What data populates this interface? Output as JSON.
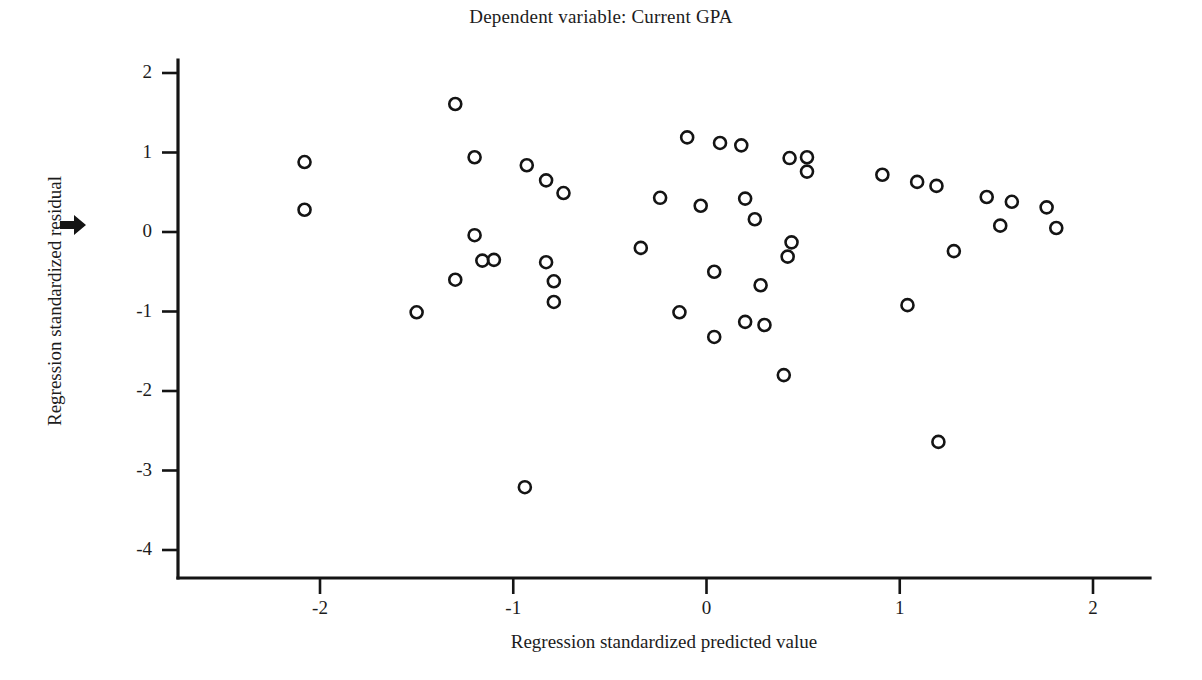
{
  "chart_data": {
    "type": "scatter",
    "title": "Dependent variable: Current GPA",
    "xlabel": "Regression standardized predicted value",
    "ylabel": "Regression standardized residual",
    "xlim": [
      -2.73,
      2.29
    ],
    "ylim": [
      -4.35,
      2.25
    ],
    "xticks": [
      -2,
      -1,
      0,
      1,
      2
    ],
    "xtick_labels": [
      "-2",
      "-1",
      "0",
      "1",
      "2"
    ],
    "yticks": [
      2,
      1,
      0,
      -1,
      -2,
      -3,
      -4
    ],
    "ytick_labels": [
      "2",
      "1",
      "0",
      "-1",
      "-2",
      "-3",
      "-4"
    ],
    "grid": false,
    "legend": false,
    "marker": "open-circle",
    "marker_color": "#141414",
    "points": [
      {
        "x": -2.08,
        "y": 0.88
      },
      {
        "x": -2.08,
        "y": 0.28
      },
      {
        "x": -1.3,
        "y": 1.61
      },
      {
        "x": -1.2,
        "y": 0.94
      },
      {
        "x": -1.2,
        "y": -0.04
      },
      {
        "x": -1.16,
        "y": -0.36
      },
      {
        "x": -1.1,
        "y": -0.35
      },
      {
        "x": -1.3,
        "y": -0.6
      },
      {
        "x": -1.5,
        "y": -1.01
      },
      {
        "x": -0.93,
        "y": 0.84
      },
      {
        "x": -0.83,
        "y": 0.65
      },
      {
        "x": -0.74,
        "y": 0.49
      },
      {
        "x": -0.83,
        "y": -0.38
      },
      {
        "x": -0.79,
        "y": -0.62
      },
      {
        "x": -0.79,
        "y": -0.88
      },
      {
        "x": -0.94,
        "y": -3.21
      },
      {
        "x": -0.34,
        "y": -0.2
      },
      {
        "x": -0.1,
        "y": 1.19
      },
      {
        "x": 0.07,
        "y": 1.12
      },
      {
        "x": 0.18,
        "y": 1.09
      },
      {
        "x": 0.43,
        "y": 0.93
      },
      {
        "x": 0.52,
        "y": 0.94
      },
      {
        "x": 0.52,
        "y": 0.76
      },
      {
        "x": -0.24,
        "y": 0.43
      },
      {
        "x": -0.03,
        "y": 0.33
      },
      {
        "x": 0.2,
        "y": 0.42
      },
      {
        "x": 0.25,
        "y": 0.16
      },
      {
        "x": 0.44,
        "y": -0.13
      },
      {
        "x": 0.42,
        "y": -0.31
      },
      {
        "x": 0.04,
        "y": -0.5
      },
      {
        "x": 0.28,
        "y": -0.67
      },
      {
        "x": -0.14,
        "y": -1.01
      },
      {
        "x": 0.2,
        "y": -1.13
      },
      {
        "x": 0.3,
        "y": -1.17
      },
      {
        "x": 0.04,
        "y": -1.32
      },
      {
        "x": 0.4,
        "y": -1.8
      },
      {
        "x": 0.91,
        "y": 0.72
      },
      {
        "x": 1.09,
        "y": 0.63
      },
      {
        "x": 1.19,
        "y": 0.58
      },
      {
        "x": 1.45,
        "y": 0.44
      },
      {
        "x": 1.58,
        "y": 0.38
      },
      {
        "x": 1.76,
        "y": 0.31
      },
      {
        "x": 1.52,
        "y": 0.08
      },
      {
        "x": 1.81,
        "y": 0.05
      },
      {
        "x": 1.28,
        "y": -0.24
      },
      {
        "x": 1.04,
        "y": -0.92
      },
      {
        "x": 1.2,
        "y": -2.64
      }
    ]
  },
  "annotations": {
    "pointer_arrow": "right-arrow-marker"
  }
}
